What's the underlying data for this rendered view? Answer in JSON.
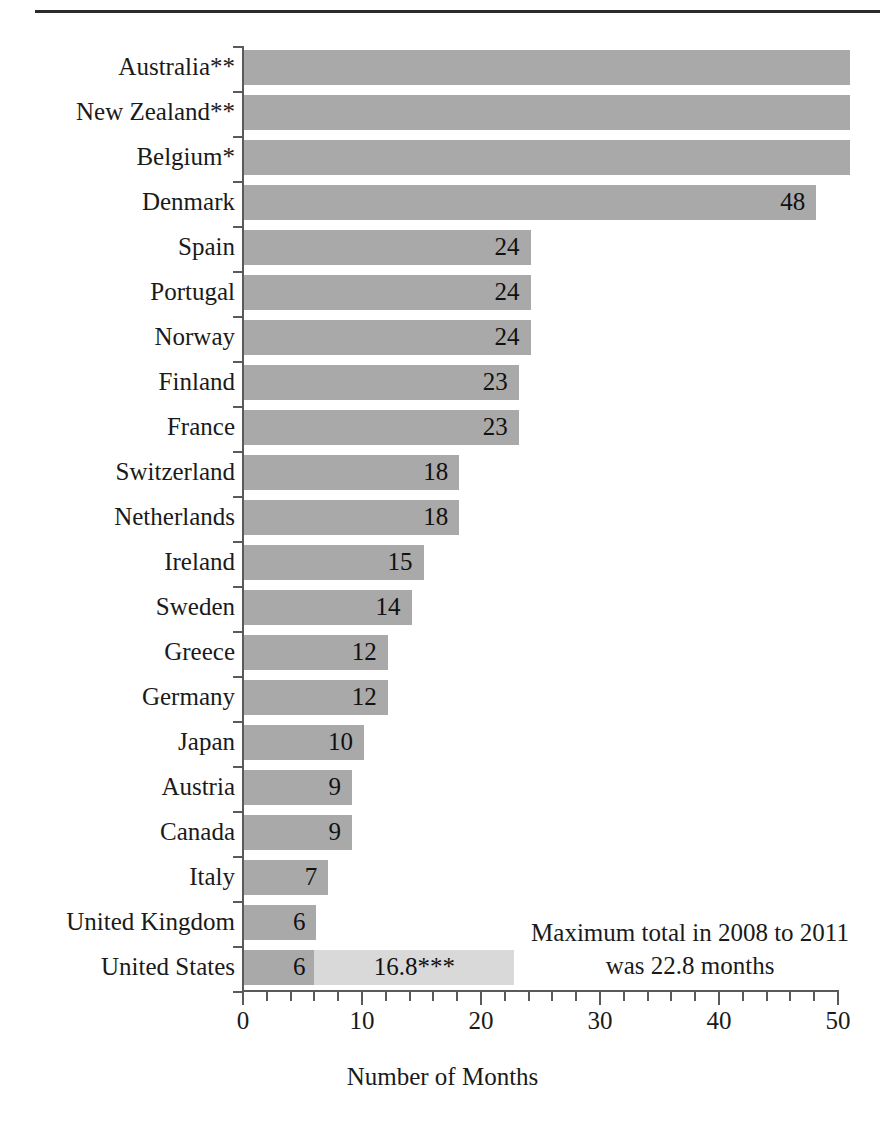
{
  "chart_data": {
    "type": "bar",
    "orientation": "horizontal",
    "title": "",
    "xlabel": "Number of Months",
    "ylabel": "",
    "xlim": [
      0,
      50
    ],
    "xticks": [
      0,
      10,
      20,
      30,
      40,
      50
    ],
    "xtick_labels": [
      "0",
      "10",
      "20",
      "30",
      "40",
      "50"
    ],
    "minor_tick_interval": 2,
    "grid": false,
    "legend": null,
    "categories": [
      "Australia**",
      "New Zealand**",
      "Belgium*",
      "Denmark",
      "Spain",
      "Portugal",
      "Norway",
      "Finland",
      "France",
      "Switzerland",
      "Netherlands",
      "Ireland",
      "Sweden",
      "Greece",
      "Germany",
      "Japan",
      "Austria",
      "Canada",
      "Italy",
      "United Kingdom",
      "United States"
    ],
    "values": [
      50.8,
      50.8,
      50.8,
      48,
      24,
      24,
      24,
      23,
      23,
      18,
      18,
      15,
      14,
      12,
      12,
      10,
      9,
      9,
      7,
      6,
      6
    ],
    "value_labels": [
      "",
      "",
      "",
      "48",
      "24",
      "24",
      "24",
      "23",
      "23",
      "18",
      "18",
      "15",
      "14",
      "12",
      "12",
      "10",
      "9",
      "9",
      "7",
      "6",
      "6"
    ],
    "stacked_extra": {
      "category": "United States",
      "base_value": 6,
      "base_label": "6",
      "extra_value": 16.8,
      "extra_label": "16.8***",
      "total": 22.8
    },
    "annotation": {
      "line1": "Maximum total in 2008 to 2011",
      "line2": "was 22.8 months"
    },
    "colors": {
      "bar": "#a9a9a9",
      "bar_light": "#d9d9d9",
      "axis": "#5a5a5a",
      "rule": "#2b2b2b",
      "text": "#1a1a1a"
    }
  }
}
